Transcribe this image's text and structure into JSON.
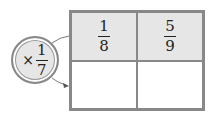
{
  "operator": {
    "symbol": "×",
    "numerator": "1",
    "denominator": "7"
  },
  "grid": {
    "top_row": [
      {
        "numerator": "1",
        "denominator": "8"
      },
      {
        "numerator": "5",
        "denominator": "9"
      }
    ],
    "bottom_row": [
      {
        "value": ""
      },
      {
        "value": ""
      }
    ]
  }
}
